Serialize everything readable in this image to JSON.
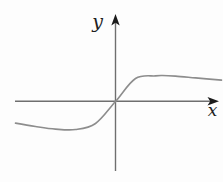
{
  "figure": {
    "x_axis_label": "x",
    "y_axis_label": "y",
    "background_color": "#fdfdfd",
    "axis_color": "#6f6f6f",
    "arrowhead_color": "#1b1b1b",
    "curve_color": "#8d8d8d",
    "label_color": "#1f1f1f"
  },
  "chart_data": {
    "type": "line",
    "title": "",
    "xlabel": "x",
    "ylabel": "y",
    "grid": false,
    "legend": null,
    "x_ticks": [],
    "y_ticks": [],
    "axes_through_origin": true,
    "xlim": [
      -5.0,
      5.35
    ],
    "ylim": [
      -4.0,
      4.35
    ],
    "series": [
      {
        "name": "odd-s-curve",
        "x": [
          -5.0,
          -4.0,
          -3.0,
          -2.0,
          -1.0,
          0.0,
          1.0,
          2.0,
          2.35,
          3.0,
          4.0,
          5.3
        ],
        "y": [
          -1.08,
          -1.25,
          -1.38,
          -1.4,
          -1.1,
          0.0,
          1.15,
          1.28,
          1.3,
          1.27,
          1.18,
          1.07
        ]
      }
    ]
  }
}
